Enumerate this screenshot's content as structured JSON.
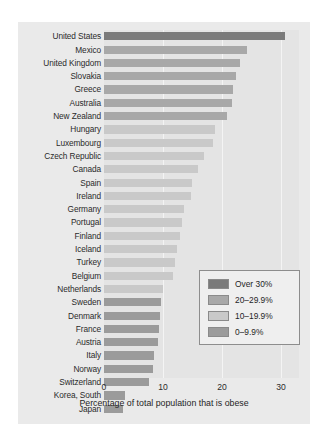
{
  "chart_data": {
    "type": "bar",
    "orientation": "horizontal",
    "title": "",
    "xlabel": "Percentage of total population that is obese",
    "ylabel": "",
    "xlim": [
      0,
      33
    ],
    "xticks": [
      0,
      10,
      20,
      30
    ],
    "grid": true,
    "legend_position": "inside-lower-right",
    "categories": [
      "United States",
      "Mexico",
      "United Kingdom",
      "Slovakia",
      "Greece",
      "Australia",
      "New Zealand",
      "Hungary",
      "Luxembourg",
      "Czech Republic",
      "Canada",
      "Spain",
      "Ireland",
      "Germany",
      "Portugal",
      "Finland",
      "Iceland",
      "Turkey",
      "Belgium",
      "Netherlands",
      "Sweden",
      "Denmark",
      "France",
      "Austria",
      "Italy",
      "Norway",
      "Switzerland",
      "Korea, South",
      "Japan"
    ],
    "values": [
      30.6,
      24.2,
      23.0,
      22.4,
      21.9,
      21.7,
      20.9,
      18.8,
      18.4,
      17.0,
      15.9,
      14.9,
      14.8,
      13.6,
      13.3,
      12.8,
      12.4,
      12.0,
      11.7,
      10.0,
      9.7,
      9.5,
      9.4,
      9.1,
      8.5,
      8.3,
      7.7,
      3.5,
      3.2
    ],
    "bands": [
      {
        "label": "Over 30%",
        "min": 30,
        "max": 100,
        "color": "#7a7a7a"
      },
      {
        "label": "20–29.9%",
        "min": 20,
        "max": 29.9,
        "color": "#a8a8a8"
      },
      {
        "label": "10–19.9%",
        "min": 10,
        "max": 19.9,
        "color": "#c9c9c9"
      },
      {
        "label": "0–9.9%",
        "min": 0,
        "max": 9.9,
        "color": "#9b9b9b"
      }
    ],
    "bar_colors": [
      "#7a7a7a",
      "#a8a8a8",
      "#a8a8a8",
      "#a8a8a8",
      "#a8a8a8",
      "#a8a8a8",
      "#a8a8a8",
      "#c9c9c9",
      "#c9c9c9",
      "#c9c9c9",
      "#c9c9c9",
      "#c9c9c9",
      "#c9c9c9",
      "#c9c9c9",
      "#c9c9c9",
      "#c9c9c9",
      "#c9c9c9",
      "#c9c9c9",
      "#c9c9c9",
      "#c9c9c9",
      "#9b9b9b",
      "#9b9b9b",
      "#9b9b9b",
      "#9b9b9b",
      "#9b9b9b",
      "#9b9b9b",
      "#9b9b9b",
      "#9b9b9b",
      "#9b9b9b"
    ]
  },
  "legend": {
    "items": [
      {
        "label": "Over 30%",
        "color": "#7a7a7a"
      },
      {
        "label": "20–29.9%",
        "color": "#a8a8a8"
      },
      {
        "label": "10–19.9%",
        "color": "#c9c9c9"
      },
      {
        "label": "0–9.9%",
        "color": "#9b9b9b"
      }
    ]
  }
}
